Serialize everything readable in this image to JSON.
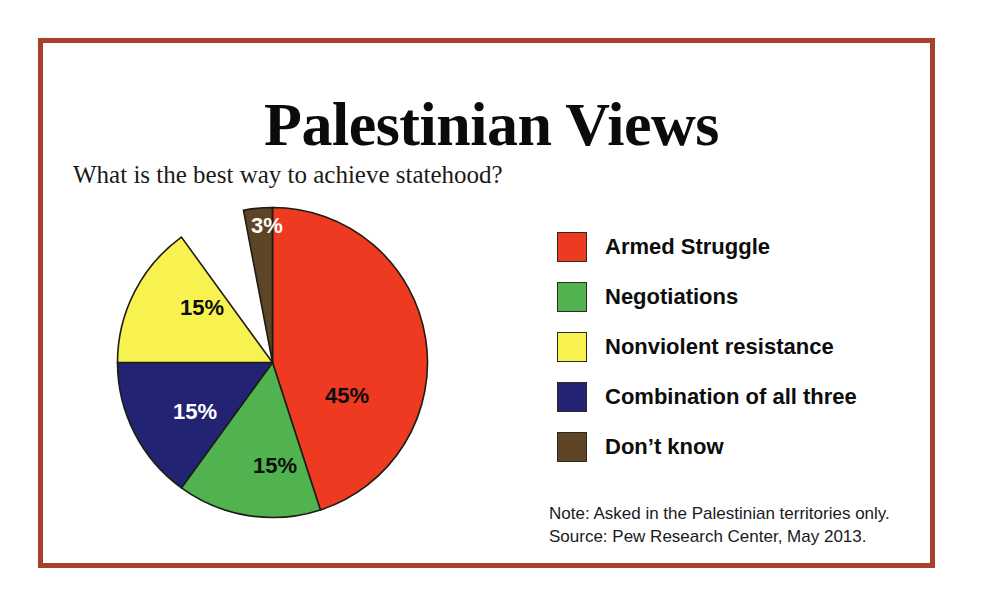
{
  "frame": {
    "border_color": "#a8402c",
    "background": "#ffffff"
  },
  "header": {
    "title": "Palestinian Views",
    "subtitle": "What is the best way to achieve statehood?"
  },
  "legend": {
    "items": [
      {
        "label": "Armed Struggle",
        "color": "#ee3a20"
      },
      {
        "label": "Negotiations",
        "color": "#51b34f"
      },
      {
        "label": "Nonviolent resistance",
        "color": "#f7f24f"
      },
      {
        "label": "Combination of all three",
        "color": "#222372"
      },
      {
        "label": "Don’t know",
        "color": "#5e4526"
      }
    ]
  },
  "notes": {
    "note": "Note: Asked in the Palestinian territories only.",
    "source": "Source: Pew Research Center, May 2013."
  },
  "chart_data": {
    "type": "pie",
    "title": "Palestinian Views",
    "subtitle": "What is the best way to achieve statehood?",
    "xlabel": "",
    "ylabel": "",
    "units": "percent",
    "start_angle_deg": 0,
    "direction": "clockwise",
    "legend_position": "right",
    "grid": false,
    "categories": [
      "Armed Struggle",
      "Negotiations",
      "Combination of all three",
      "Nonviolent resistance",
      "Don’t know"
    ],
    "values": [
      45,
      15,
      15,
      15,
      3
    ],
    "slices": [
      {
        "name": "Armed Struggle",
        "value": 45,
        "label": "45%",
        "color": "#ee3a20",
        "label_color": "dark",
        "start_deg": 0,
        "end_deg": 162,
        "label_x": 232,
        "label_y": 192
      },
      {
        "name": "Negotiations",
        "value": 15,
        "label": "15%",
        "color": "#51b34f",
        "label_color": "dark",
        "start_deg": 162,
        "end_deg": 216,
        "label_x": 160,
        "label_y": 262
      },
      {
        "name": "Combination of all three",
        "value": 15,
        "label": "15%",
        "color": "#222372",
        "label_color": "light",
        "start_deg": 216,
        "end_deg": 270,
        "label_x": 80,
        "label_y": 208
      },
      {
        "name": "Nonviolent resistance",
        "value": 15,
        "label": "15%",
        "color": "#f7f24f",
        "label_color": "dark",
        "start_deg": 270,
        "end_deg": 324,
        "label_x": 87,
        "label_y": 104
      },
      {
        "name": "Don’t know",
        "value": 3,
        "label": "3%",
        "color": "#5e4526",
        "label_color": "light",
        "start_deg": 349.2,
        "end_deg": 360,
        "label_x": 152,
        "label_y": 22
      }
    ]
  }
}
